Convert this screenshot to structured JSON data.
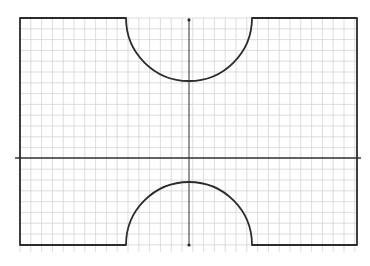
{
  "diagram": {
    "type": "coordinate-grid-shape",
    "colors": {
      "background": "#ffffff",
      "grid": "#d4d4d4",
      "axis": "#333333",
      "shape": "#2b2b2b"
    },
    "grid": {
      "x_start": 20,
      "x_end": 357,
      "y_start": 18,
      "y_end": 252,
      "spacing": 10.8
    },
    "axes": {
      "horizontal": {
        "y": 158,
        "x1": 15,
        "x2": 361
      },
      "vertical": {
        "x": 189,
        "y1": 18,
        "y2": 246
      },
      "markers": [
        {
          "x": 189,
          "y": 20
        },
        {
          "x": 189,
          "y": 245
        }
      ]
    },
    "shape": {
      "left": 20,
      "right": 357,
      "top": 18,
      "bottom": 245,
      "top_notch": {
        "cx": 189,
        "cy": 18,
        "r": 63
      },
      "bottom_notch": {
        "cx": 189,
        "cy": 245,
        "r": 63
      }
    }
  }
}
